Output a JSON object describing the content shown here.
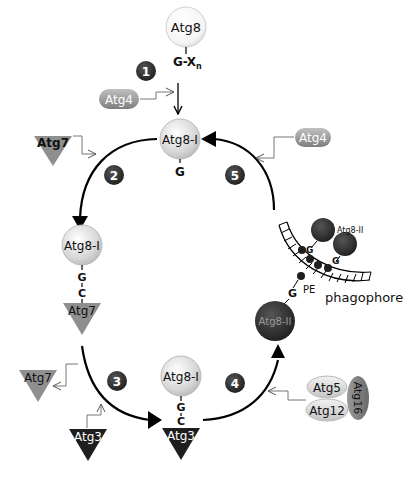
{
  "diagram": {
    "steps": [
      "1",
      "2",
      "3",
      "4",
      "5"
    ],
    "nodes": {
      "atg8_top": "Atg8",
      "gx": "G-X",
      "gx_sub": "n",
      "atg4_left": "Atg4",
      "atg4_right": "Atg4",
      "atg8i_top": "Atg8-I",
      "g_top": "G",
      "atg7_enzyme_top": "Atg7",
      "atg8i_left": "Atg8-I",
      "g_left": "G",
      "c_left": "C",
      "atg7_bound": "Atg7",
      "atg7_released": "Atg7",
      "atg3_enzyme": "Atg3",
      "atg8i_bottom": "Atg8-I",
      "g_bottom": "G",
      "c_bottom": "C",
      "atg3_bound": "Atg3",
      "atg5": "Atg5",
      "atg12": "Atg12",
      "atg16": "Atg16",
      "atg8ii_lipidated": "Atg8-II",
      "g_lipid": "G",
      "pe": "PE",
      "phagophore": "phagophore",
      "atg8ii_membrane": "Atg8-II",
      "g_m1": "G",
      "g_m2": "G"
    },
    "colors": {
      "light_circle": "#d9d9d9",
      "dark_circle": "#2e2e2e",
      "atg7_gray": "#8f8f8f",
      "atg3_black": "#1e1e1e",
      "atg4_pill": "#9a9a9a",
      "step_badge": "#222222"
    }
  }
}
